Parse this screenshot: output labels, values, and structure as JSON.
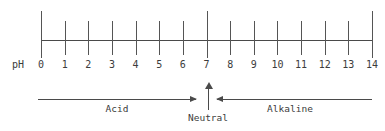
{
  "diagram": {
    "axis_caption": "pH",
    "line_color": "#4a4a4a",
    "text_color": "#3c3c3c",
    "background": "#ffffff"
  },
  "chart_data": {
    "type": "line",
    "xlabel": "pH",
    "ylabel": "",
    "xlim": [
      0,
      14
    ],
    "grid": false,
    "legend": "none",
    "categories": [
      "0",
      "1",
      "2",
      "3",
      "4",
      "5",
      "6",
      "7",
      "8",
      "9",
      "10",
      "11",
      "12",
      "13",
      "14"
    ],
    "values": [
      0,
      1,
      2,
      3,
      4,
      5,
      6,
      7,
      8,
      9,
      10,
      11,
      12,
      13,
      14
    ],
    "major_ticks": [
      0,
      7,
      14
    ],
    "minor_ticks": [
      1,
      2,
      3,
      4,
      5,
      6,
      8,
      9,
      10,
      11,
      12,
      13
    ],
    "annotations": [
      {
        "label": "Acid",
        "range": [
          0,
          7
        ],
        "direction": "right"
      },
      {
        "label": "Neutral",
        "value": 7,
        "direction": "up"
      },
      {
        "label": "Alkaline",
        "range": [
          7,
          14
        ],
        "direction": "left"
      }
    ]
  },
  "ticks": [
    {
      "label": "0",
      "major": true
    },
    {
      "label": "1",
      "major": false
    },
    {
      "label": "2",
      "major": false
    },
    {
      "label": "3",
      "major": false
    },
    {
      "label": "4",
      "major": false
    },
    {
      "label": "5",
      "major": false
    },
    {
      "label": "6",
      "major": false
    },
    {
      "label": "7",
      "major": true
    },
    {
      "label": "8",
      "major": false
    },
    {
      "label": "9",
      "major": false
    },
    {
      "label": "10",
      "major": false
    },
    {
      "label": "11",
      "major": false
    },
    {
      "label": "12",
      "major": false
    },
    {
      "label": "13",
      "major": false
    },
    {
      "label": "14",
      "major": true
    }
  ],
  "labels": {
    "acid": "Acid",
    "neutral": "Neutral",
    "alkaline": "Alkaline"
  }
}
